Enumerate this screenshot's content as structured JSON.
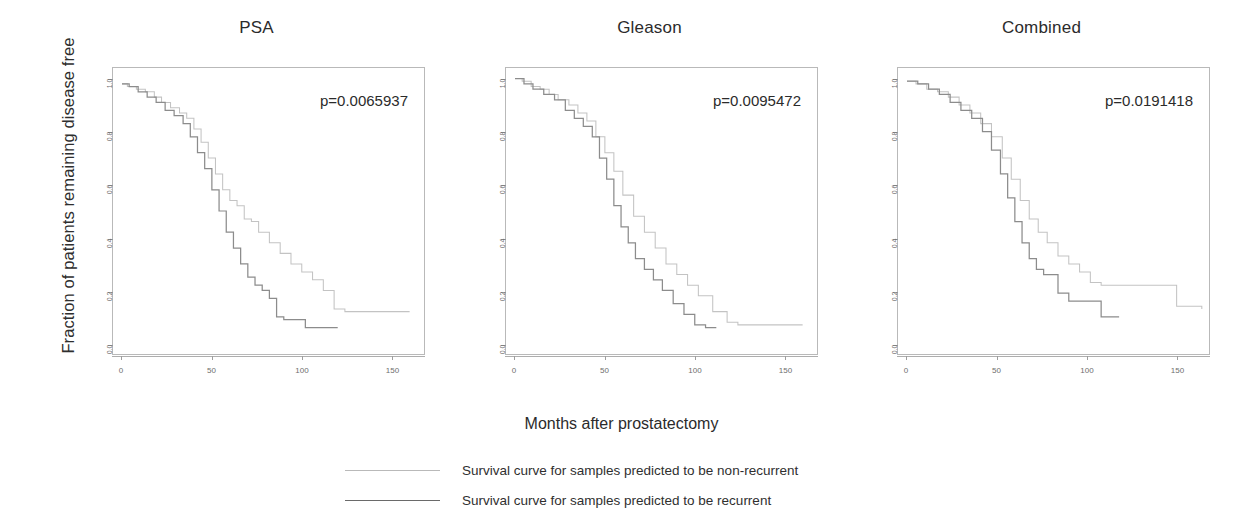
{
  "figure": {
    "ylabel": "Fraction of patients remaining disease free",
    "xlabel": "Months after prostatectomy"
  },
  "legend": {
    "items": [
      {
        "label": "Survival curve for samples predicted to be non-recurrent",
        "color": "#b9b9b9",
        "key": "non-recurrent"
      },
      {
        "label": "Survival curve for samples predicted to be recurrent",
        "color": "#6a6a6a",
        "key": "recurrent"
      }
    ]
  },
  "panels": [
    {
      "title": "PSA",
      "pvalue": "p=0.0065937"
    },
    {
      "title": "Gleason",
      "pvalue": "p=0.0095472"
    },
    {
      "title": "Combined",
      "pvalue": "p=0.0191418"
    }
  ],
  "axes": {
    "yticks": [
      "0.0",
      "0.2",
      "0.4",
      "0.6",
      "0.8",
      "1.0"
    ],
    "yvalues": [
      0.0,
      0.2,
      0.4,
      0.6,
      0.8,
      1.0
    ],
    "xticks": [
      "0",
      "50",
      "100",
      "150"
    ],
    "xvalues": [
      0,
      50,
      100,
      150
    ],
    "xlim": [
      -5,
      168
    ],
    "ylim": [
      -0.04,
      1.04
    ]
  },
  "chart_data": {
    "type": "line",
    "xlabel": "Months after prostatectomy",
    "ylabel": "Fraction of patients remaining disease free",
    "xlim": [
      -5,
      168
    ],
    "ylim": [
      -0.04,
      1.04
    ],
    "grid": false,
    "legend_position": "below",
    "panels": [
      {
        "title": "PSA",
        "annotation": "p=0.0065937",
        "series": [
          {
            "name": "Survival curve for samples predicted to be non-recurrent",
            "color": "#c3c3c3",
            "x": [
              0,
              3,
              8,
              13,
              18,
              22,
              27,
              32,
              36,
              40,
              44,
              48,
              52,
              56,
              60,
              64,
              68,
              72,
              76,
              82,
              88,
              94,
              100,
              106,
              112,
              118,
              124,
              130,
              160
            ],
            "y": [
              0.98,
              0.97,
              0.96,
              0.95,
              0.93,
              0.91,
              0.89,
              0.87,
              0.85,
              0.81,
              0.76,
              0.7,
              0.64,
              0.58,
              0.54,
              0.52,
              0.47,
              0.46,
              0.42,
              0.38,
              0.34,
              0.3,
              0.27,
              0.24,
              0.2,
              0.13,
              0.12,
              0.12,
              0.12
            ]
          },
          {
            "name": "Survival curve for samples predicted to be recurrent",
            "color": "#8c8c8c",
            "x": [
              0,
              4,
              9,
              14,
              19,
              24,
              29,
              34,
              38,
              42,
              46,
              50,
              54,
              58,
              62,
              66,
              70,
              74,
              78,
              82,
              86,
              90,
              96,
              102,
              108,
              120
            ],
            "y": [
              0.98,
              0.97,
              0.95,
              0.93,
              0.91,
              0.88,
              0.86,
              0.83,
              0.78,
              0.72,
              0.66,
              0.58,
              0.5,
              0.42,
              0.36,
              0.3,
              0.25,
              0.22,
              0.2,
              0.17,
              0.1,
              0.09,
              0.09,
              0.06,
              0.06,
              0.06
            ]
          }
        ]
      },
      {
        "title": "Gleason",
        "annotation": "p=0.0095472",
        "series": [
          {
            "name": "Survival curve for samples predicted to be non-recurrent",
            "color": "#c3c3c3",
            "x": [
              0,
              4,
              9,
              14,
              19,
              24,
              30,
              35,
              40,
              45,
              50,
              55,
              60,
              66,
              72,
              78,
              84,
              90,
              96,
              102,
              110,
              118,
              124,
              160
            ],
            "y": [
              1.0,
              0.99,
              0.97,
              0.96,
              0.94,
              0.92,
              0.9,
              0.87,
              0.84,
              0.78,
              0.72,
              0.65,
              0.56,
              0.48,
              0.42,
              0.36,
              0.3,
              0.26,
              0.22,
              0.18,
              0.12,
              0.08,
              0.07,
              0.07
            ]
          },
          {
            "name": "Survival curve for samples predicted to be recurrent",
            "color": "#8c8c8c",
            "x": [
              0,
              5,
              10,
              16,
              22,
              28,
              33,
              38,
              43,
              47,
              51,
              55,
              59,
              63,
              67,
              72,
              77,
              82,
              88,
              94,
              100,
              106,
              112
            ],
            "y": [
              1.0,
              0.98,
              0.96,
              0.94,
              0.92,
              0.88,
              0.85,
              0.82,
              0.78,
              0.7,
              0.62,
              0.52,
              0.44,
              0.38,
              0.32,
              0.28,
              0.24,
              0.2,
              0.15,
              0.11,
              0.07,
              0.06,
              0.06
            ]
          }
        ]
      },
      {
        "title": "Combined",
        "annotation": "p=0.0191418",
        "series": [
          {
            "name": "Survival curve for samples predicted to be non-recurrent",
            "color": "#c3c3c3",
            "x": [
              0,
              5,
              11,
              17,
              23,
              29,
              35,
              41,
              47,
              53,
              58,
              63,
              68,
              73,
              78,
              84,
              90,
              96,
              102,
              108,
              116,
              126,
              136,
              150,
              164
            ],
            "y": [
              0.99,
              0.98,
              0.96,
              0.95,
              0.93,
              0.9,
              0.87,
              0.83,
              0.78,
              0.7,
              0.62,
              0.54,
              0.47,
              0.42,
              0.38,
              0.33,
              0.3,
              0.27,
              0.23,
              0.22,
              0.22,
              0.22,
              0.22,
              0.14,
              0.13
            ]
          },
          {
            "name": "Survival curve for samples predicted to be recurrent",
            "color": "#8c8c8c",
            "x": [
              0,
              6,
              12,
              18,
              24,
              30,
              36,
              42,
              47,
              52,
              56,
              60,
              64,
              68,
              72,
              76,
              80,
              84,
              90,
              96,
              102,
              108,
              118
            ],
            "y": [
              0.99,
              0.98,
              0.96,
              0.94,
              0.91,
              0.88,
              0.85,
              0.8,
              0.73,
              0.64,
              0.55,
              0.46,
              0.38,
              0.32,
              0.28,
              0.26,
              0.26,
              0.19,
              0.16,
              0.16,
              0.16,
              0.1,
              0.1
            ]
          }
        ]
      }
    ]
  }
}
